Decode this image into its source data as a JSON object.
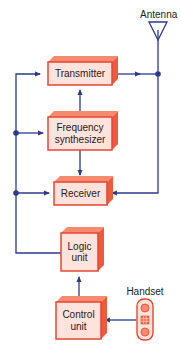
{
  "diagram": {
    "type": "block-diagram",
    "colors": {
      "line": "#2b3a8f",
      "box_fill": "#fde3dc",
      "box_border": "#e8452f",
      "box_shadow": "#f26b4f",
      "text": "#222222"
    },
    "labels": {
      "antenna": "Antenna",
      "handset": "Handset"
    },
    "blocks": {
      "transmitter": {
        "label": "Transmitter"
      },
      "frequency_synthesizer": {
        "line1": "Frequency",
        "line2": "synthesizer"
      },
      "receiver": {
        "label": "Receiver"
      },
      "logic_unit": {
        "line1": "Logic",
        "line2": "unit"
      },
      "control_unit": {
        "line1": "Control",
        "line2": "unit"
      }
    },
    "connections": [
      {
        "from": "Handset",
        "to": "Control unit"
      },
      {
        "from": "Control unit",
        "to": "Logic unit"
      },
      {
        "from": "Logic unit",
        "to": "Transmitter"
      },
      {
        "from": "Logic unit",
        "to": "Frequency synthesizer"
      },
      {
        "from": "Logic unit",
        "to": "Receiver"
      },
      {
        "from": "Frequency synthesizer",
        "to": "Transmitter"
      },
      {
        "from": "Frequency synthesizer",
        "to": "Receiver"
      },
      {
        "from": "Transmitter",
        "to": "Antenna"
      },
      {
        "from": "Antenna",
        "to": "Receiver"
      }
    ]
  }
}
